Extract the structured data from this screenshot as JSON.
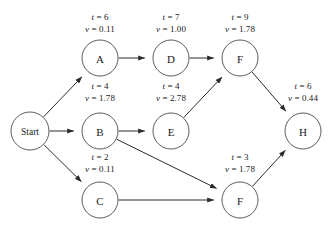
{
  "diagram": {
    "type": "directed-activity-network",
    "nodes": [
      {
        "id": "start",
        "label": "Start",
        "cx": 30,
        "cy": 131,
        "r": 19,
        "size": "small"
      },
      {
        "id": "a",
        "label": "A",
        "cx": 100,
        "cy": 58,
        "r": 18,
        "size": "normal"
      },
      {
        "id": "d",
        "label": "D",
        "cx": 171,
        "cy": 58,
        "r": 18,
        "size": "normal"
      },
      {
        "id": "f1",
        "label": "F",
        "cx": 240,
        "cy": 58,
        "r": 18,
        "size": "normal"
      },
      {
        "id": "b",
        "label": "B",
        "cx": 100,
        "cy": 131,
        "r": 18,
        "size": "normal"
      },
      {
        "id": "e",
        "label": "E",
        "cx": 171,
        "cy": 131,
        "r": 18,
        "size": "normal"
      },
      {
        "id": "h",
        "label": "H",
        "cx": 303,
        "cy": 131,
        "r": 18,
        "size": "normal"
      },
      {
        "id": "c",
        "label": "C",
        "cx": 100,
        "cy": 200,
        "r": 18,
        "size": "normal"
      },
      {
        "id": "f2",
        "label": "F",
        "cx": 240,
        "cy": 200,
        "r": 18,
        "size": "normal"
      }
    ],
    "edges": [
      {
        "id": "start-a",
        "from": "start",
        "to": "a"
      },
      {
        "id": "start-b",
        "from": "start",
        "to": "b"
      },
      {
        "id": "start-c",
        "from": "start",
        "to": "c"
      },
      {
        "id": "a-d",
        "from": "a",
        "to": "d"
      },
      {
        "id": "d-f1",
        "from": "d",
        "to": "f1"
      },
      {
        "id": "b-e",
        "from": "b",
        "to": "e"
      },
      {
        "id": "e-f1",
        "from": "e",
        "to": "f1"
      },
      {
        "id": "b-f2",
        "from": "b",
        "to": "f2"
      },
      {
        "id": "c-f2",
        "from": "c",
        "to": "f2"
      },
      {
        "id": "f1-h",
        "from": "f1",
        "to": "h"
      },
      {
        "id": "f2-h",
        "from": "f2",
        "to": "h"
      }
    ],
    "labels": [
      {
        "id": "label-a",
        "t_line": "t = 6",
        "v_line": "v = 0.11",
        "x": 100,
        "y": 12,
        "node": "a"
      },
      {
        "id": "label-d",
        "t_line": "t = 7",
        "v_line": "v = 1.00",
        "x": 171,
        "y": 12,
        "node": "d"
      },
      {
        "id": "label-f1",
        "t_line": "t = 9",
        "v_line": "v = 1.78",
        "x": 240,
        "y": 12,
        "node": "f1"
      },
      {
        "id": "label-b",
        "t_line": "t = 4",
        "v_line": "v = 1.78",
        "x": 100,
        "y": 81,
        "node": "b"
      },
      {
        "id": "label-e",
        "t_line": "t = 4",
        "v_line": "v = 2.78",
        "x": 171,
        "y": 81,
        "node": "e"
      },
      {
        "id": "label-h",
        "t_line": "t = 6",
        "v_line": "v = 0.44",
        "x": 303,
        "y": 81,
        "node": "h"
      },
      {
        "id": "label-c",
        "t_line": "t = 2",
        "v_line": "v = 0.11",
        "x": 100,
        "y": 152,
        "node": "c"
      },
      {
        "id": "label-f2",
        "t_line": "t = 3",
        "v_line": "v = 1.78",
        "x": 240,
        "y": 152,
        "node": "f2"
      }
    ]
  }
}
